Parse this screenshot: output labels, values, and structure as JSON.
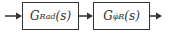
{
  "diagram": {
    "blocks": [
      {
        "main": "G",
        "sub": "Rad",
        "arg": "(s)"
      },
      {
        "main": "G",
        "sub": "φ̇R",
        "arg": "(s)"
      }
    ],
    "connections": [
      "input→block1",
      "block1→block2",
      "block2→output"
    ],
    "colors": {
      "stroke": "#333333",
      "background": "#ffffff"
    }
  }
}
